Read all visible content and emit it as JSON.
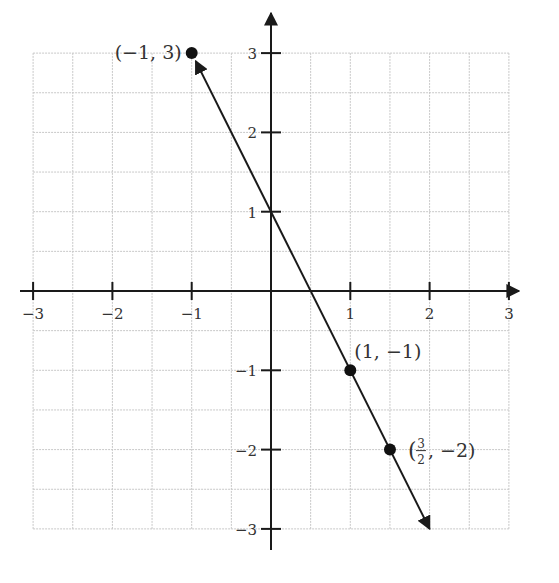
{
  "chart_data": {
    "type": "line",
    "title": "",
    "xlabel": "",
    "ylabel": "",
    "xlim": [
      -3,
      3
    ],
    "ylim": [
      -3,
      3
    ],
    "grid": true,
    "grid_step": 0.5,
    "x_ticks": [
      -3,
      -2,
      -1,
      1,
      2,
      3
    ],
    "y_ticks": [
      -3,
      -2,
      -1,
      1,
      2,
      3
    ],
    "x_tick_labels": [
      "−3",
      "−2",
      "−1",
      "1",
      "2",
      "3"
    ],
    "y_tick_labels": [
      "−3",
      "−2",
      "−1",
      "1",
      "2",
      "3"
    ],
    "line": {
      "equation": "y = -2x + 1",
      "slope": -2,
      "intercept": 1,
      "x_range": [
        -1,
        2
      ],
      "arrows_both_ends": true
    },
    "points": [
      {
        "x": -1,
        "y": 3,
        "label": "(−1, 3)"
      },
      {
        "x": 1,
        "y": -1,
        "label": "(1, −1)"
      },
      {
        "x": 1.5,
        "y": -2,
        "label_left": "(",
        "label_num": "3",
        "label_den": "2",
        "label_right": ", −2)"
      }
    ],
    "colors": {
      "axis": "#1a1a1a",
      "grid": "#c8c8c8",
      "line": "#1a1a1a",
      "point": "#111111",
      "text": "#333333"
    }
  }
}
